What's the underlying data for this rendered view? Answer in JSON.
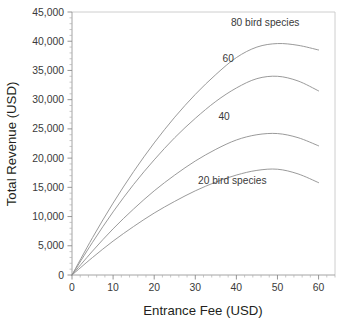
{
  "chart_data": {
    "type": "line",
    "title": "",
    "subtitle": "",
    "xlabel": "Entrance Fee (USD)",
    "ylabel": "Total Revenue (USD)",
    "xlim": [
      0,
      64
    ],
    "ylim": [
      0,
      45000
    ],
    "x_major_ticks": [
      0,
      10,
      20,
      30,
      40,
      50,
      60
    ],
    "x_tick_labels": [
      "0",
      "10",
      "20",
      "30",
      "40",
      "50",
      "60"
    ],
    "x_minor_step": 2,
    "y_major_ticks": [
      0,
      5000,
      10000,
      15000,
      20000,
      25000,
      30000,
      35000,
      40000,
      45000
    ],
    "y_tick_labels": [
      "0",
      "5,000",
      "10,000",
      "15,000",
      "20,000",
      "25,000",
      "30,000",
      "35,000",
      "40,000",
      "45,000"
    ],
    "y_minor_step": 1000,
    "grid": false,
    "legend_position": "inline-annotations",
    "line_color": "#8f8f8f",
    "text_color": "#231f20",
    "x": [
      0,
      5,
      10,
      15,
      20,
      25,
      30,
      35,
      40,
      45,
      50,
      55,
      60
    ],
    "series": [
      {
        "name": "80 bird species",
        "annotation": "80 bird species",
        "annotation_x": 47,
        "annotation_y": 42600,
        "peak_x": 48,
        "peak_y": 39600,
        "values": [
          0,
          6400,
          12300,
          17700,
          22600,
          27000,
          30900,
          34300,
          37200,
          39000,
          39600,
          39300,
          38500
        ]
      },
      {
        "name": "60",
        "annotation": "60",
        "annotation_x": 38,
        "annotation_y": 36400,
        "peak_x": 46,
        "peak_y": 34000,
        "values": [
          0,
          5600,
          10800,
          15500,
          19700,
          23500,
          26800,
          29700,
          32000,
          33600,
          34000,
          33200,
          31500
        ]
      },
      {
        "name": "40",
        "annotation": "40",
        "annotation_x": 37,
        "annotation_y": 26600,
        "peak_x": 44,
        "peak_y": 24200,
        "values": [
          0,
          4100,
          7900,
          11300,
          14400,
          17100,
          19500,
          21500,
          23100,
          24000,
          24200,
          23500,
          22100
        ]
      },
      {
        "name": "20 bird species",
        "annotation": "20 bird species",
        "annotation_x": 39,
        "annotation_y": 15600,
        "peak_x": 42,
        "peak_y": 18100,
        "values": [
          0,
          3000,
          5800,
          8300,
          10600,
          12600,
          14400,
          15900,
          17100,
          17900,
          18100,
          17300,
          15800
        ]
      }
    ]
  }
}
